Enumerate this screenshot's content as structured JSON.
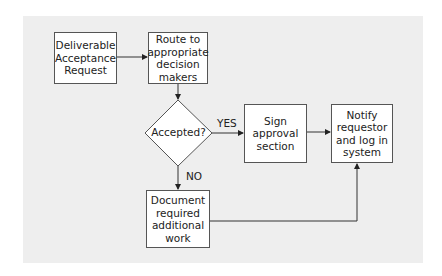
{
  "diagram": {
    "type": "flowchart",
    "nodes": {
      "request": {
        "label": "Deliverable\nAcceptance\nRequest"
      },
      "route": {
        "label": "Route to\nappropriate\ndecision\nmakers"
      },
      "decision": {
        "label": "Accepted?"
      },
      "sign": {
        "label": "Sign\napproval\nsection"
      },
      "notify": {
        "label": "Notify\nrequestor\nand log in\nsystem"
      },
      "document": {
        "label": "Document\nrequired\nadditional\nwork"
      }
    },
    "edge_labels": {
      "yes": "YES",
      "no": "NO"
    },
    "edges": [
      {
        "from": "request",
        "to": "route"
      },
      {
        "from": "route",
        "to": "decision"
      },
      {
        "from": "decision",
        "to": "sign",
        "label": "YES"
      },
      {
        "from": "decision",
        "to": "document",
        "label": "NO"
      },
      {
        "from": "sign",
        "to": "notify"
      },
      {
        "from": "document",
        "to": "notify"
      }
    ],
    "colors": {
      "background_panel": "#eeeeee",
      "box_fill": "#ffffff",
      "stroke": "#333333"
    }
  }
}
